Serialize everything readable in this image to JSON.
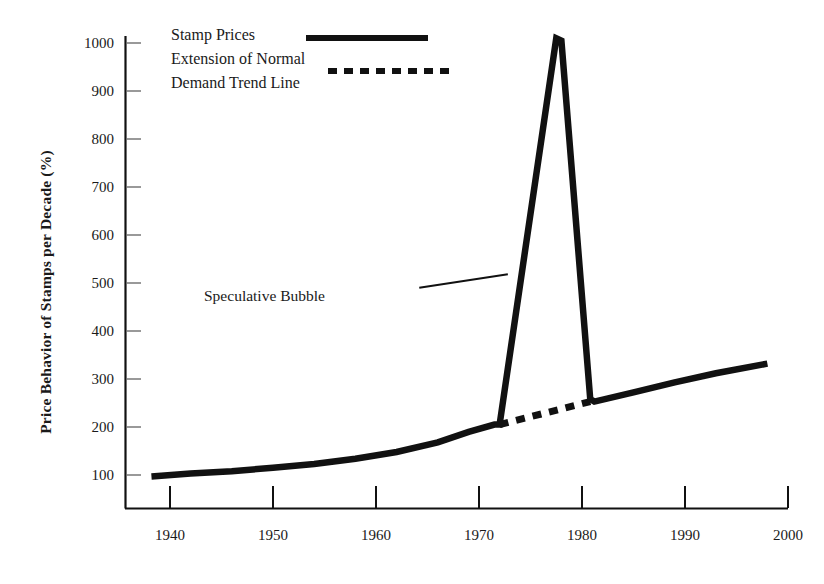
{
  "figure": {
    "background": "#ffffff",
    "ink_color": "#111111"
  },
  "chart_data": {
    "type": "line",
    "title": "",
    "xlabel": "",
    "ylabel": "Price Behavior of Stamps per Decade (%)",
    "xlim": [
      1938,
      2001
    ],
    "ylim": [
      0,
      1040
    ],
    "grid": false,
    "legend_position": "top-left-inside",
    "xticks": [
      1940,
      1950,
      1960,
      1970,
      1980,
      1990,
      2000
    ],
    "xtick_labels": [
      "1940",
      "1950",
      "1960",
      "1970",
      "1980",
      "1990",
      "2000"
    ],
    "yticks": [
      100,
      200,
      300,
      400,
      500,
      600,
      700,
      800,
      900,
      1000
    ],
    "ytick_labels": [
      "100",
      "200",
      "300",
      "400",
      "500",
      "600",
      "700",
      "800",
      "900",
      "1000"
    ],
    "series": [
      {
        "name": "Stamp Prices",
        "style": "solid",
        "color": "#111111",
        "linewidth": 6,
        "x": [
          1938.2,
          1942,
          1946,
          1950,
          1954,
          1958,
          1962,
          1966,
          1969,
          1971.5,
          1972.0,
          1977.5,
          1978.0,
          1980.8,
          1981.2,
          1985,
          1989,
          1993,
          1998
        ],
        "y": [
          97,
          103,
          108,
          115,
          123,
          134,
          148,
          168,
          190,
          205,
          205,
          1010,
          1005,
          258,
          253,
          272,
          293,
          312,
          332
        ]
      },
      {
        "name": "Extension of Normal Demand Trend Line",
        "style": "dotted",
        "color": "#111111",
        "linewidth": 6,
        "x": [
          1972.0,
          1980.8
        ],
        "y": [
          205,
          253
        ]
      }
    ],
    "annotations": [
      {
        "text": "Speculative Bubble",
        "text_x": 1942.5,
        "text_y": 508,
        "leader_from_x": 1964.2,
        "leader_from_y": 490,
        "leader_to_x": 1972.8,
        "leader_to_y": 518
      }
    ]
  },
  "legend": {
    "entries": [
      {
        "label": "Stamp Prices",
        "style": "solid"
      },
      {
        "label_line1": "Extension of Normal",
        "label_line2": "Demand Trend Line",
        "style": "dotted"
      }
    ]
  }
}
